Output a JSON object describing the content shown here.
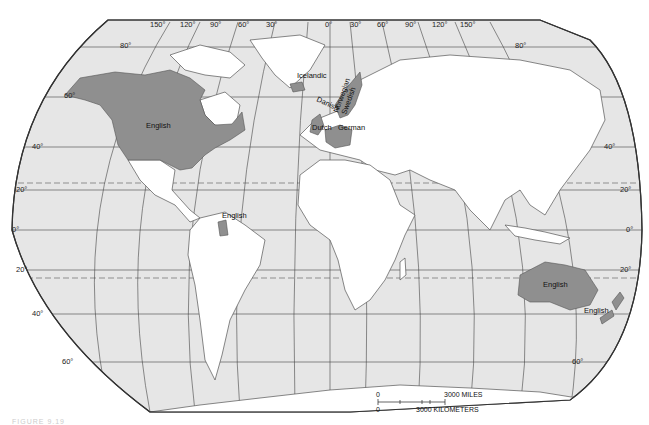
{
  "map": {
    "title": "Distribution of Germanic languages",
    "projection": "Robinson-like world map",
    "colors": {
      "ocean": "#e6e6e6",
      "land": "#ffffff",
      "language_highlight": "#8f8f8f",
      "lines": "#444444"
    },
    "longitude_labels": [
      "150°",
      "120°",
      "90°",
      "60°",
      "30°",
      "0°",
      "30°",
      "60°",
      "90°",
      "120°",
      "150°"
    ],
    "latitude_labels_left": [
      "80°",
      "60°",
      "40°",
      "20°",
      "0°",
      "20°",
      "40°",
      "60°"
    ],
    "latitude_labels_right": [
      "80°",
      "40°",
      "20°",
      "0°",
      "20°",
      "60°"
    ],
    "language_labels": [
      {
        "name": "English",
        "region": "North America"
      },
      {
        "name": "Icelandic",
        "region": "Iceland"
      },
      {
        "name": "Norwegian",
        "region": "Norway"
      },
      {
        "name": "Swedish",
        "region": "Sweden"
      },
      {
        "name": "Danish",
        "region": "Denmark"
      },
      {
        "name": "Dutch",
        "region": "Netherlands"
      },
      {
        "name": "German",
        "region": "Germany"
      },
      {
        "name": "English",
        "region": "Guyana"
      },
      {
        "name": "English",
        "region": "Australia"
      },
      {
        "name": "English",
        "region": "New Zealand"
      }
    ],
    "scale_bar": {
      "miles_zero": "0",
      "miles_label": "3000  MILES",
      "km_zero": "0",
      "km_label": "3000  KILOMETERS"
    },
    "caption": "FIGURE 9.19"
  }
}
